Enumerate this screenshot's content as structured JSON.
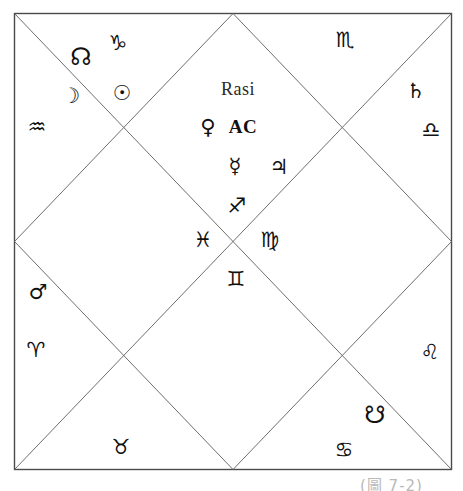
{
  "chart_data": {
    "type": "diagram",
    "title": "Rasi",
    "style": "north-indian-vedic-chart",
    "frame": {
      "x": 14,
      "y": 13,
      "width": 438,
      "height": 457,
      "stroke": "#4a4a4a"
    },
    "lines_description": "outer square, two corner-to-corner diagonals, inner diamond joining the midpoints of the four sides",
    "glyph_color": "#111111",
    "glyphs": [
      {
        "name": "capricorn",
        "symbol": "♑",
        "label": "Capricorn",
        "kind": "sign",
        "x": 118,
        "y": 43
      },
      {
        "name": "rahu-north-node",
        "symbol": "☊",
        "label": "Rahu (North Node)",
        "kind": "node",
        "x": 81,
        "y": 57
      },
      {
        "name": "moon",
        "symbol": "☽",
        "label": "Moon",
        "kind": "planet",
        "x": 71,
        "y": 96
      },
      {
        "name": "sun",
        "symbol": "☉",
        "label": "Sun",
        "kind": "planet",
        "x": 122,
        "y": 93
      },
      {
        "name": "aquarius",
        "symbol": "♒",
        "label": "Aquarius",
        "kind": "sign",
        "x": 37,
        "y": 127
      },
      {
        "name": "scorpio",
        "symbol": "♏",
        "label": "Scorpio",
        "kind": "sign",
        "x": 345,
        "y": 40
      },
      {
        "name": "saturn",
        "symbol": "♄",
        "label": "Saturn",
        "kind": "planet",
        "x": 416,
        "y": 91
      },
      {
        "name": "libra",
        "symbol": "♎",
        "label": "Libra",
        "kind": "sign",
        "x": 431,
        "y": 130
      },
      {
        "name": "rasi-title",
        "symbol": "Rasi",
        "label": "Rasi",
        "kind": "title",
        "x": 238,
        "y": 89
      },
      {
        "name": "venus",
        "symbol": "♀",
        "label": "Venus",
        "kind": "planet",
        "x": 208,
        "y": 127
      },
      {
        "name": "ascendant",
        "symbol": "AC",
        "label": "Ascendant",
        "kind": "label-ac",
        "x": 243,
        "y": 126
      },
      {
        "name": "mercury",
        "symbol": "☿",
        "label": "Mercury",
        "kind": "planet",
        "x": 235,
        "y": 166
      },
      {
        "name": "jupiter",
        "symbol": "♃",
        "label": "Jupiter",
        "kind": "planet",
        "x": 279,
        "y": 167
      },
      {
        "name": "sagittarius",
        "symbol": "♐",
        "label": "Sagittarius",
        "kind": "sign",
        "x": 237,
        "y": 206
      },
      {
        "name": "pisces",
        "symbol": "♓",
        "label": "Pisces",
        "kind": "sign",
        "x": 203,
        "y": 240
      },
      {
        "name": "virgo",
        "symbol": "♍",
        "label": "Virgo",
        "kind": "sign",
        "x": 270,
        "y": 240
      },
      {
        "name": "gemini",
        "symbol": "♊",
        "label": "Gemini",
        "kind": "sign",
        "x": 236,
        "y": 279
      },
      {
        "name": "mars",
        "symbol": "♂",
        "label": "Mars",
        "kind": "planet",
        "x": 38,
        "y": 292
      },
      {
        "name": "aries",
        "symbol": "♈",
        "label": "Aries",
        "kind": "sign",
        "x": 36,
        "y": 350
      },
      {
        "name": "leo",
        "symbol": "♌",
        "label": "Leo",
        "kind": "sign",
        "x": 430,
        "y": 352
      },
      {
        "name": "ketu-south-node",
        "symbol": "☋",
        "label": "Ketu (South Node)",
        "kind": "node",
        "x": 375,
        "y": 415
      },
      {
        "name": "cancer",
        "symbol": "♋",
        "label": "Cancer",
        "kind": "sign",
        "x": 344,
        "y": 450
      },
      {
        "name": "taurus",
        "symbol": "♉",
        "label": "Taurus",
        "kind": "sign",
        "x": 121,
        "y": 447
      }
    ]
  },
  "caption": {
    "text": "(圖 7-2)"
  }
}
